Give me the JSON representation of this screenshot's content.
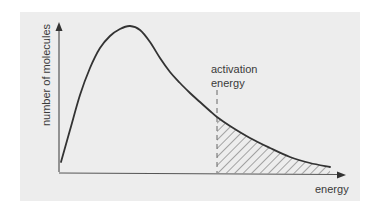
{
  "diagram": {
    "y_axis_label": "number of molecules",
    "x_axis_label": "energy",
    "annotation": {
      "line1": "activation",
      "line2": "energy"
    },
    "colors": {
      "background": "#ffffff",
      "panel": "#ededed",
      "curve": "#333333",
      "axes": "#555555",
      "hatch": "#555555",
      "text": "#3a3a3a"
    },
    "curve_points": [
      [
        61,
        162
      ],
      [
        70,
        130
      ],
      [
        80,
        95
      ],
      [
        90,
        68
      ],
      [
        100,
        48
      ],
      [
        110,
        36
      ],
      [
        120,
        29
      ],
      [
        130,
        26
      ],
      [
        140,
        30
      ],
      [
        150,
        42
      ],
      [
        160,
        58
      ],
      [
        170,
        72
      ],
      [
        180,
        83
      ],
      [
        190,
        93
      ],
      [
        200,
        102
      ],
      [
        210,
        111
      ],
      [
        217,
        117
      ],
      [
        230,
        126
      ],
      [
        250,
        138
      ],
      [
        270,
        148
      ],
      [
        290,
        157
      ],
      [
        310,
        163
      ],
      [
        330,
        167
      ]
    ],
    "activation_energy_x": 217,
    "shaded_region": "area under curve to the right of activation energy (hatched)"
  }
}
